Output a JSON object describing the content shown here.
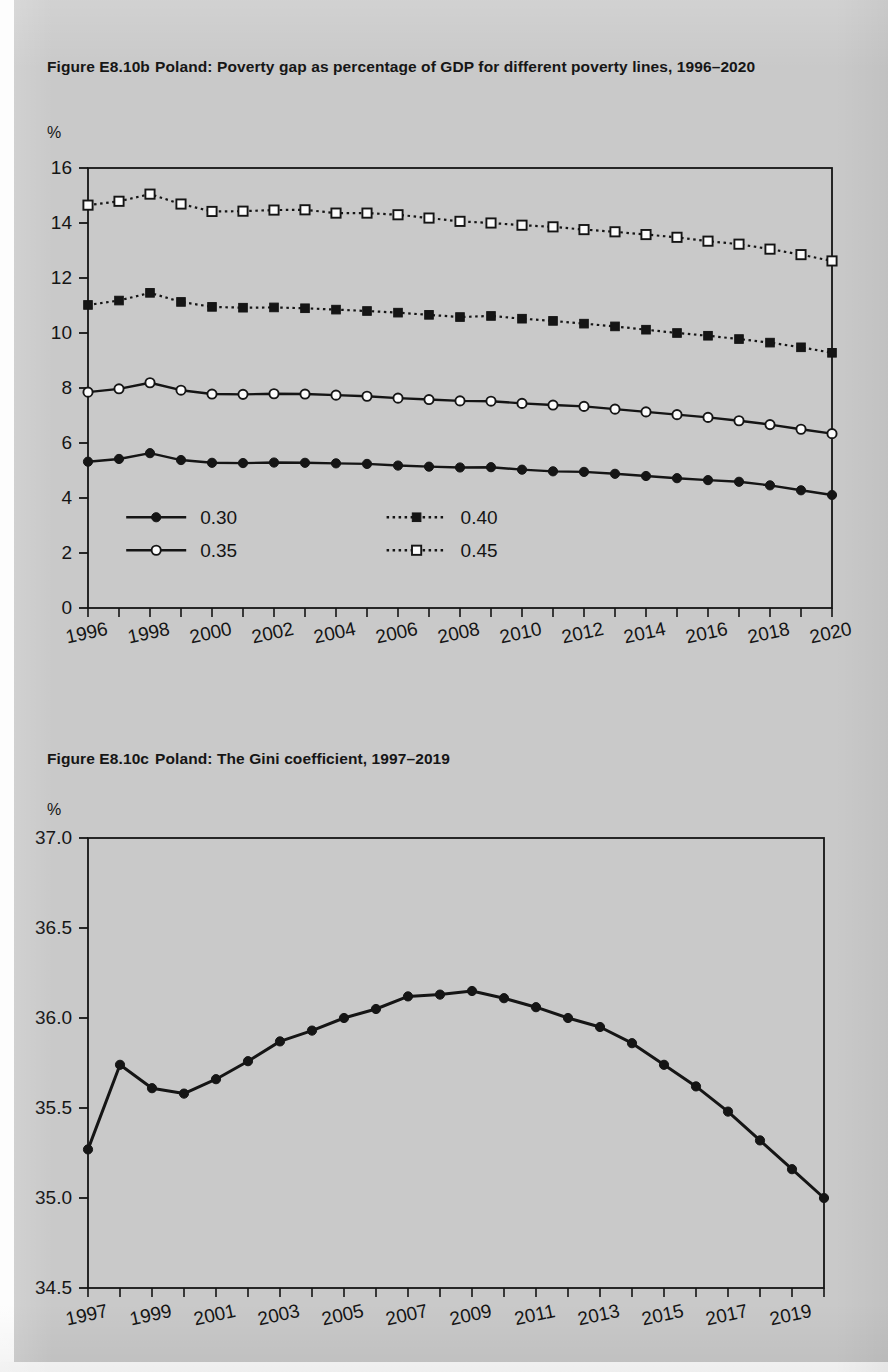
{
  "page": {
    "background_color": "#c9c9c9",
    "ink_color": "#151515"
  },
  "figures": [
    {
      "id": "E8.10b",
      "number_label": "Figure E8.10b",
      "title_text": "Poland: Poverty gap as percentage of GDP for different poverty lines, 1996–2020",
      "axis_unit": "%"
    },
    {
      "id": "E8.10c",
      "number_label": "Figure E8.10c",
      "title_text": "Poland: The Gini coefficient, 1997–2019",
      "axis_unit": "%"
    }
  ],
  "chart_data": [
    {
      "type": "line",
      "title": "Poland: Poverty gap as percentage of GDP for different poverty lines, 1996–2020",
      "figure_number": "Figure E8.10b",
      "xlabel": "",
      "ylabel": "%",
      "ylim": [
        0,
        16
      ],
      "ytick_values": [
        0,
        2,
        4,
        6,
        8,
        10,
        12,
        14,
        16
      ],
      "ytick_labels": [
        "0",
        "2",
        "4",
        "6",
        "8",
        "10",
        "12",
        "14",
        "16"
      ],
      "xlim": [
        1996,
        2020
      ],
      "x": [
        1996,
        1997,
        1998,
        1999,
        2000,
        2001,
        2002,
        2003,
        2004,
        2005,
        2006,
        2007,
        2008,
        2009,
        2010,
        2011,
        2012,
        2013,
        2014,
        2015,
        2016,
        2017,
        2018,
        2019,
        2020
      ],
      "xtick_labels": [
        "1996",
        "1998",
        "2000",
        "2002",
        "2004",
        "2006",
        "2008",
        "2010",
        "2012",
        "2014",
        "2016",
        "2018",
        "2020"
      ],
      "xtick_labelled_values": [
        1996,
        1998,
        2000,
        2002,
        2004,
        2006,
        2008,
        2010,
        2012,
        2014,
        2016,
        2018,
        2020
      ],
      "grid": false,
      "legend_position": "inside-lower-left",
      "series": [
        {
          "name": "0.30",
          "marker": "filled-circle",
          "line": "solid",
          "values": [
            5.32,
            5.42,
            5.63,
            5.38,
            5.28,
            5.27,
            5.29,
            5.28,
            5.26,
            5.24,
            5.18,
            5.14,
            5.11,
            5.12,
            5.03,
            4.97,
            4.95,
            4.88,
            4.8,
            4.72,
            4.65,
            4.59,
            4.46,
            4.28,
            4.11
          ]
        },
        {
          "name": "0.35",
          "marker": "open-circle",
          "line": "solid",
          "values": [
            7.85,
            7.97,
            8.19,
            7.92,
            7.78,
            7.77,
            7.79,
            7.78,
            7.74,
            7.7,
            7.63,
            7.58,
            7.53,
            7.52,
            7.44,
            7.38,
            7.33,
            7.23,
            7.13,
            7.03,
            6.93,
            6.81,
            6.67,
            6.5,
            6.34
          ]
        },
        {
          "name": "0.40",
          "marker": "filled-square",
          "line": "dotted",
          "values": [
            11.02,
            11.18,
            11.46,
            11.13,
            10.95,
            10.92,
            10.93,
            10.9,
            10.85,
            10.8,
            10.74,
            10.66,
            10.58,
            10.62,
            10.52,
            10.44,
            10.34,
            10.24,
            10.12,
            10.0,
            9.9,
            9.78,
            9.65,
            9.48,
            9.28
          ]
        },
        {
          "name": "0.45",
          "marker": "open-square",
          "line": "dotted",
          "values": [
            14.65,
            14.79,
            15.05,
            14.69,
            14.42,
            14.43,
            14.47,
            14.48,
            14.36,
            14.36,
            14.3,
            14.18,
            14.06,
            14.0,
            13.92,
            13.86,
            13.76,
            13.68,
            13.58,
            13.48,
            13.34,
            13.23,
            13.05,
            12.85,
            12.62
          ]
        }
      ]
    },
    {
      "type": "line",
      "title": "Poland: The Gini coefficient, 1997–2019",
      "figure_number": "Figure E8.10c",
      "xlabel": "",
      "ylabel": "%",
      "ylim": [
        34.5,
        37.0
      ],
      "ytick_values": [
        34.5,
        35.0,
        35.5,
        36.0,
        36.5,
        37.0
      ],
      "ytick_labels": [
        "34.5",
        "35.0",
        "35.5",
        "36.0",
        "36.5",
        "37.0"
      ],
      "xlim": [
        1997,
        2020
      ],
      "x": [
        1997,
        1998,
        1999,
        2000,
        2001,
        2002,
        2003,
        2004,
        2005,
        2006,
        2007,
        2008,
        2009,
        2010,
        2011,
        2012,
        2013,
        2014,
        2015,
        2016,
        2017,
        2018,
        2019,
        2020
      ],
      "xtick_labels": [
        "1997",
        "1999",
        "2001",
        "2003",
        "2005",
        "2007",
        "2009",
        "2011",
        "2013",
        "2015",
        "2017",
        "2019"
      ],
      "xtick_labelled_values": [
        1997,
        1999,
        2001,
        2003,
        2005,
        2007,
        2009,
        2011,
        2013,
        2015,
        2017,
        2019
      ],
      "grid": false,
      "legend_position": "none",
      "series": [
        {
          "name": "Gini coefficient",
          "marker": "filled-circle",
          "line": "solid",
          "values": [
            35.27,
            35.74,
            35.61,
            35.58,
            35.66,
            35.76,
            35.87,
            35.93,
            36.0,
            36.05,
            36.12,
            36.13,
            36.15,
            36.11,
            36.06,
            36.0,
            35.95,
            35.86,
            35.74,
            35.62,
            35.48,
            35.32,
            35.16,
            35.0
          ]
        }
      ]
    }
  ]
}
